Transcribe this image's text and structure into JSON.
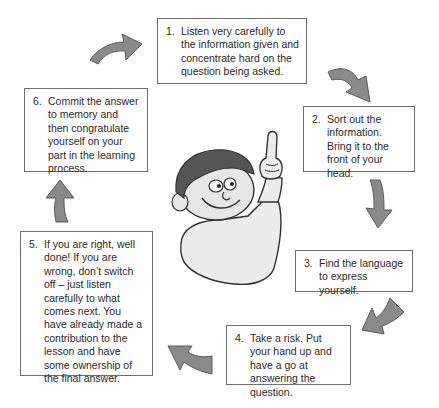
{
  "diagram": {
    "type": "cycle",
    "steps": [
      {
        "num": "1.",
        "text": "Listen very carefully to the information given and concentrate hard on the question being asked."
      },
      {
        "num": "2.",
        "text": "Sort out the information. Bring it to the front of your head."
      },
      {
        "num": "3.",
        "text": "Find the language to express yourself."
      },
      {
        "num": "4.",
        "text": "Take a risk. Put your hand up and have a go at answering the question."
      },
      {
        "num": "5.",
        "text": "If you are right, well done! If you are wrong, don’t switch off – just listen carefully to what comes next. You have already made a contribution to the lesson and have some ownership of the final answer."
      },
      {
        "num": "6.",
        "text": "Commit the answer to memory and then congratulate yourself on your part in the learning process."
      }
    ],
    "colors": {
      "arrow_fill": "#8a8a8a",
      "arrow_stroke": "#5a5a5a",
      "border": "#6e6e6e",
      "hair": "#555555",
      "skin": "#e6e6e6"
    }
  }
}
